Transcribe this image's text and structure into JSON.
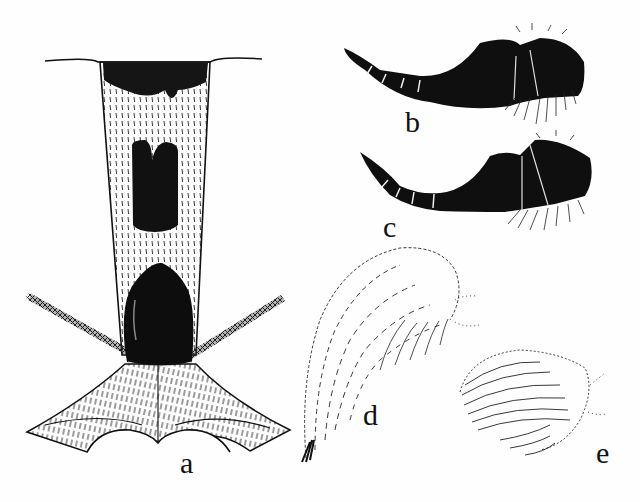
{
  "figure": {
    "panels": [
      {
        "id": "a",
        "label": "a",
        "description": "dorsal view of petiole/segment with dark spots and hatched plates"
      },
      {
        "id": "b",
        "label": "b",
        "description": "dark segmented appendage with bristled tip"
      },
      {
        "id": "c",
        "label": "c",
        "description": "dark segmented appendage, variant, with bristled tip"
      },
      {
        "id": "d",
        "label": "d",
        "description": "hairy elongated lobe (stippled)"
      },
      {
        "id": "e",
        "label": "e",
        "description": "hairy rounded lobe (stippled)"
      }
    ],
    "colors": {
      "ink": "#111111",
      "paper": "#fefefe"
    }
  }
}
